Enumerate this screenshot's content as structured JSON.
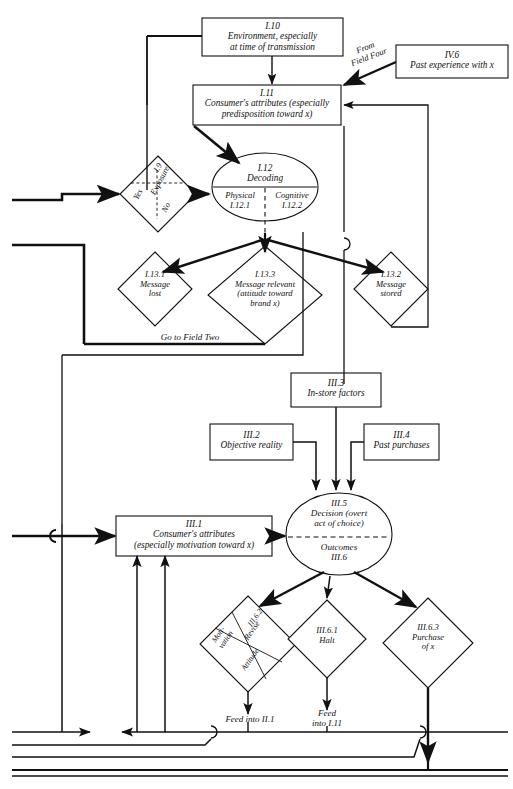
{
  "diagram": {
    "line_color": "#111111",
    "fill_color": "#ffffff"
  },
  "boxes": [
    {
      "id": "I.10",
      "code": "I.10",
      "line1": "Environment, especially",
      "line2": "at time of transmission"
    },
    {
      "id": "IV.6",
      "code": "IV.6",
      "line1": "Past experience with x",
      "line2": ""
    },
    {
      "id": "I.11",
      "code": "I.11",
      "line1": "Consumer's attributes (especially",
      "line2": "predisposition toward x)"
    },
    {
      "id": "III.3",
      "code": "III.3",
      "line1": "In-store factors",
      "line2": ""
    },
    {
      "id": "III.2",
      "code": "III.2",
      "line1": "Objective reality",
      "line2": ""
    },
    {
      "id": "III.4",
      "code": "III.4",
      "line1": "Past purchases",
      "line2": ""
    },
    {
      "id": "III.1",
      "code": "III.1",
      "line1": "Consumer's attributes",
      "line2": "(especially motivation toward x)"
    }
  ],
  "ellipses": [
    {
      "id": "I.12",
      "code": "I.12",
      "label": "Decoding",
      "left_cell_label": "Physical",
      "left_cell_code": "I.12.1",
      "right_cell_label": "Cognitive",
      "right_cell_code": "I.12.2"
    },
    {
      "id": "III.5",
      "code": "III.5",
      "line1": "Decision (overt",
      "line2": "act of choice)",
      "lower_label": "Outcomes",
      "lower_code": "III.6"
    }
  ],
  "diamonds": [
    {
      "id": "I.9",
      "code": "I.9",
      "label": "Exposure",
      "cell_a": "Yes",
      "cell_b": "No"
    },
    {
      "id": "I.13.1",
      "code": "I.13.1",
      "line1": "Message",
      "line2": "lost",
      "line3": ""
    },
    {
      "id": "I.13.3",
      "code": "I.13.3",
      "line1": "Message relevant",
      "line2": "(attitude toward",
      "line3": "brand x)"
    },
    {
      "id": "I.13.2",
      "code": "I.13.2",
      "line1": "Message",
      "line2": "stored",
      "line3": ""
    },
    {
      "id": "III.6.2",
      "code": "III.6.2",
      "label": "Revise",
      "cell_a": "Moti-",
      "cell_a2": "vation",
      "cell_b": "Attitude"
    },
    {
      "id": "III.6.1",
      "code": "III.6.1",
      "line1": "Halt",
      "line2": "",
      "line3": ""
    },
    {
      "id": "III.6.3",
      "code": "III.6.3",
      "line1": "Purchase",
      "line2": "of x",
      "line3": ""
    }
  ],
  "annotations": [
    {
      "id": "from-field-four",
      "line1": "From",
      "line2": "Field Four"
    },
    {
      "id": "go-to-field-two",
      "line1": "Go to Field Two",
      "line2": ""
    },
    {
      "id": "feed-into-ii1",
      "line1": "Feed into II.1",
      "line2": ""
    },
    {
      "id": "feed-into-i11",
      "line1": "Feed",
      "line2": "into I.11"
    }
  ]
}
